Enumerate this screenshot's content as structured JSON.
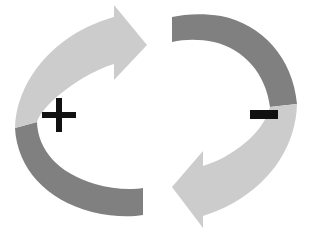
{
  "diagram": {
    "type": "cycle-diagram",
    "canvas": {
      "width": 315,
      "height": 232,
      "background": "#ffffff"
    },
    "colors": {
      "light_gray": "#cccccc",
      "dark_gray": "#808080",
      "sign_black": "#111111",
      "background": "#ffffff"
    },
    "arrows": [
      {
        "id": "clockwise-arrow",
        "name": "left-clockwise-arrow",
        "direction": "clockwise",
        "head_points": "right",
        "head_color": "#cccccc",
        "tail_color": "#808080",
        "sign": "+"
      },
      {
        "id": "counterclockwise-arrow",
        "name": "right-counterclockwise-arrow",
        "direction": "counter-clockwise",
        "head_points": "left",
        "head_color": "#cccccc",
        "tail_color": "#808080",
        "sign": "−"
      }
    ],
    "labels": {
      "positive": "+",
      "negative": "−"
    }
  }
}
